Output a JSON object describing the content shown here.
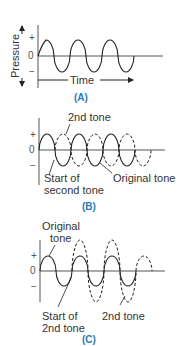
{
  "panels": [
    {
      "id": "A",
      "caption": "(A)",
      "y_label": "Pressure",
      "x_label": "Time",
      "ticks": {
        "plus": "+",
        "zero": "0",
        "minus": "−"
      }
    },
    {
      "id": "B",
      "caption": "(B)",
      "ticks": {
        "plus": "+",
        "zero": "0",
        "minus": "−"
      },
      "annotations": {
        "second_tone": "2nd tone",
        "start_line1": "Start of",
        "start_line2": "second tone",
        "original": "Original tone"
      }
    },
    {
      "id": "C",
      "caption": "(C)",
      "ticks": {
        "plus": "+",
        "zero": "0",
        "minus": "−"
      },
      "annotations": {
        "original_line1": "Original",
        "original_line2": "tone",
        "start_line1": "Start of",
        "start_line2": "2nd tone",
        "second_tone": "2nd tone"
      }
    }
  ],
  "colors": {
    "caption": "#2a7ab8",
    "line": "#333333"
  }
}
